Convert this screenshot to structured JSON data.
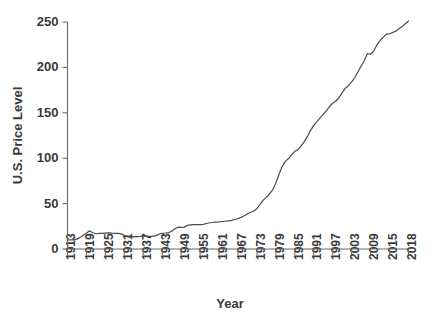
{
  "chart_data": {
    "type": "line",
    "title": "",
    "xlabel": "Year",
    "ylabel": "U.S. Price Level",
    "xlim": [
      1913,
      2018
    ],
    "ylim": [
      0,
      250
    ],
    "grid": false,
    "legend": "none",
    "y_ticks": [
      0,
      50,
      100,
      150,
      200,
      250
    ],
    "y_tick_labels": [
      "0",
      "50",
      "100",
      "150",
      "200",
      "250"
    ],
    "x_ticks": [
      1913,
      1919,
      1925,
      1931,
      1937,
      1943,
      1949,
      1955,
      1961,
      1967,
      1973,
      1979,
      1985,
      1991,
      1997,
      2003,
      2009,
      2015,
      2018
    ],
    "x_tick_labels": [
      "1913",
      "1919",
      "1925",
      "1931",
      "1937",
      "1943",
      "1949",
      "1955",
      "1961",
      "1967",
      "1973",
      "1979",
      "1985",
      "1991",
      "1997",
      "2003",
      "2009",
      "2015",
      "2018"
    ],
    "series": [
      {
        "name": "U.S. Price Level",
        "color": "#4a4a4a",
        "x": [
          1913,
          1914,
          1915,
          1916,
          1917,
          1918,
          1919,
          1920,
          1921,
          1922,
          1923,
          1924,
          1925,
          1926,
          1927,
          1928,
          1929,
          1930,
          1931,
          1932,
          1933,
          1934,
          1935,
          1936,
          1937,
          1938,
          1939,
          1940,
          1941,
          1942,
          1943,
          1944,
          1945,
          1946,
          1947,
          1948,
          1949,
          1950,
          1951,
          1952,
          1953,
          1954,
          1955,
          1956,
          1957,
          1958,
          1959,
          1960,
          1961,
          1962,
          1963,
          1964,
          1965,
          1966,
          1967,
          1968,
          1969,
          1970,
          1971,
          1972,
          1973,
          1974,
          1975,
          1976,
          1977,
          1978,
          1979,
          1980,
          1981,
          1982,
          1983,
          1984,
          1985,
          1986,
          1987,
          1988,
          1989,
          1990,
          1991,
          1992,
          1993,
          1994,
          1995,
          1996,
          1997,
          1998,
          1999,
          2000,
          2001,
          2002,
          2003,
          2004,
          2005,
          2006,
          2007,
          2008,
          2009,
          2010,
          2011,
          2012,
          2013,
          2014,
          2015,
          2016,
          2017,
          2018
        ],
        "values": [
          9.9,
          10.0,
          10.1,
          10.9,
          12.8,
          15.1,
          17.3,
          20.0,
          17.9,
          16.8,
          17.1,
          17.1,
          17.5,
          17.7,
          17.4,
          17.2,
          17.2,
          16.7,
          15.2,
          13.7,
          13.0,
          13.4,
          13.7,
          13.9,
          14.4,
          14.1,
          13.9,
          14.0,
          14.7,
          16.3,
          17.3,
          17.6,
          18.0,
          19.5,
          22.3,
          24.0,
          23.8,
          24.1,
          26.0,
          26.6,
          26.8,
          26.9,
          26.8,
          27.2,
          28.1,
          28.9,
          29.2,
          29.6,
          29.9,
          30.3,
          30.6,
          31.0,
          31.5,
          32.5,
          33.4,
          34.8,
          36.7,
          38.8,
          40.5,
          41.8,
          44.4,
          49.3,
          53.8,
          56.9,
          60.6,
          65.2,
          72.6,
          82.4,
          90.9,
          96.5,
          99.6,
          103.9,
          107.6,
          109.6,
          113.6,
          118.3,
          124.0,
          130.7,
          136.2,
          140.3,
          144.5,
          148.2,
          152.4,
          156.9,
          160.5,
          163.0,
          166.6,
          172.2,
          177.1,
          179.9,
          184.0,
          188.9,
          195.3,
          201.6,
          207.3,
          215.3,
          214.5,
          218.1,
          224.9,
          229.6,
          233.0,
          236.7,
          237.0,
          240.0,
          245.1,
          251.1
        ]
      }
    ]
  },
  "axis": {
    "y_title": "U.S. Price Level",
    "x_title": "Year"
  }
}
